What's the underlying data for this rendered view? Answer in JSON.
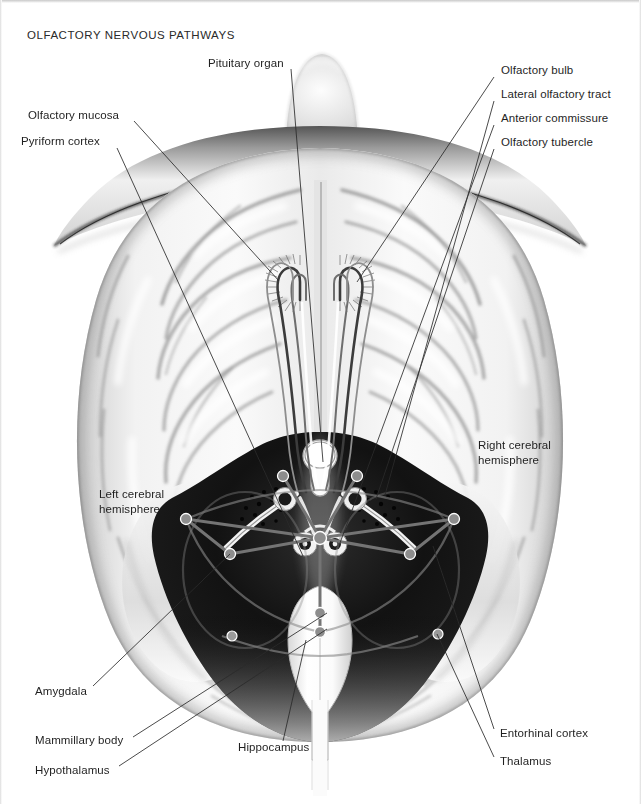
{
  "figure": {
    "title": "OLFACTORY NERVOUS PATHWAYS",
    "style": "grayscale airbrush anatomical illustration",
    "colors": {
      "background": "#ffffff",
      "ink": "#1f1f1f",
      "leader_line": "#3a3a3a",
      "cortex_light": "#f4f4f4",
      "cortex_mid": "#c9c9c9",
      "sulcus_shadow": "#7d7d7d",
      "limbic_dark": "#161616",
      "tract_highlight": "#ffffff",
      "circuit_gray": "#8a8a8a",
      "node_gray": "#6e6e6e"
    }
  },
  "labels": {
    "pituitary_organ": "Pituitary organ",
    "olfactory_mucosa": "Olfactory  mucosa",
    "pyriform_cortex": "Pyriform cortex",
    "olfactory_bulb": "Olfactory bulb",
    "lateral_olfactory_tract": "Lateral olfactory tract",
    "anterior_commissure": "Anterior commissure",
    "olfactory_tubercle": "Olfactory tubercle",
    "right_cerebral_hemisphere": "Right cerebral hemisphere",
    "left_cerebral_hemisphere": "Left cerebral hemisphere",
    "amygdala": "Amygdala",
    "mammillary_body": "Mammillary body",
    "hypothalamus": "Hypothalamus",
    "hippocampus": "Hippocampus",
    "entorhinal_cortex": "Entorhinal cortex",
    "thalamus": "Thalamus"
  },
  "callouts": [
    {
      "key": "pituitary_organ",
      "text": "Pituitary organ",
      "label_x": 208,
      "label_y": 64,
      "anchor_x": 323,
      "anchor_y": 462
    },
    {
      "key": "olfactory_mucosa",
      "text": "Olfactory  mucosa",
      "label_x": 28,
      "label_y": 116,
      "anchor_x": 279,
      "anchor_y": 281
    },
    {
      "key": "pyriform_cortex",
      "text": "Pyriform cortex",
      "label_x": 21,
      "label_y": 142,
      "anchor_x": 303,
      "anchor_y": 556
    },
    {
      "key": "olfactory_bulb",
      "text": "Olfactory bulb",
      "label_x": 501,
      "label_y": 72,
      "anchor_x": 357,
      "anchor_y": 282
    },
    {
      "key": "lateral_olfactory_tract",
      "text": "Lateral olfactory tract",
      "label_x": 501,
      "label_y": 96,
      "anchor_x": 385,
      "anchor_y": 495
    },
    {
      "key": "anterior_commissure",
      "text": "Anterior commissure",
      "label_x": 501,
      "label_y": 120,
      "anchor_x": 340,
      "anchor_y": 543
    },
    {
      "key": "olfactory_tubercle",
      "text": "Olfactory tubercle",
      "label_x": 501,
      "label_y": 144,
      "anchor_x": 376,
      "anchor_y": 499
    },
    {
      "key": "right_cerebral_hemisphere",
      "text": "Right cerebral hemisphere",
      "label_x": 480,
      "label_y": 445,
      "anchor_x": null,
      "anchor_y": null
    },
    {
      "key": "left_cerebral_hemisphere",
      "text": "Left cerebral hemisphere",
      "label_x": 99,
      "label_y": 494,
      "anchor_x": null,
      "anchor_y": null
    },
    {
      "key": "amygdala",
      "text": "Amygdala",
      "label_x": 35,
      "label_y": 692,
      "anchor_x": 230,
      "anchor_y": 554
    },
    {
      "key": "mammillary_body",
      "text": "Mammillary body",
      "label_x": 35,
      "label_y": 741,
      "anchor_x": 327,
      "anchor_y": 613
    },
    {
      "key": "hypothalamus",
      "text": "Hypothalamus",
      "label_x": 35,
      "label_y": 771,
      "anchor_x": 327,
      "anchor_y": 629
    },
    {
      "key": "hippocampus",
      "text": "Hippocampus",
      "label_x": 238,
      "label_y": 748,
      "anchor_x": 306,
      "anchor_y": 640
    },
    {
      "key": "entorhinal_cortex",
      "text": "Entorhinal cortex",
      "label_x": 500,
      "label_y": 734,
      "anchor_x": 433,
      "anchor_y": 546
    },
    {
      "key": "thalamus",
      "text": "Thalamus",
      "label_x": 500,
      "label_y": 762,
      "anchor_x": 437,
      "anchor_y": 634
    }
  ],
  "anatomy": {
    "olfactory_bulbs": 2,
    "circuit_nodes": 11,
    "tubercle_dot_clusters": 2,
    "midline_structures": [
      "pituitary organ",
      "anterior commissure",
      "mammillary body",
      "brainstem"
    ]
  }
}
